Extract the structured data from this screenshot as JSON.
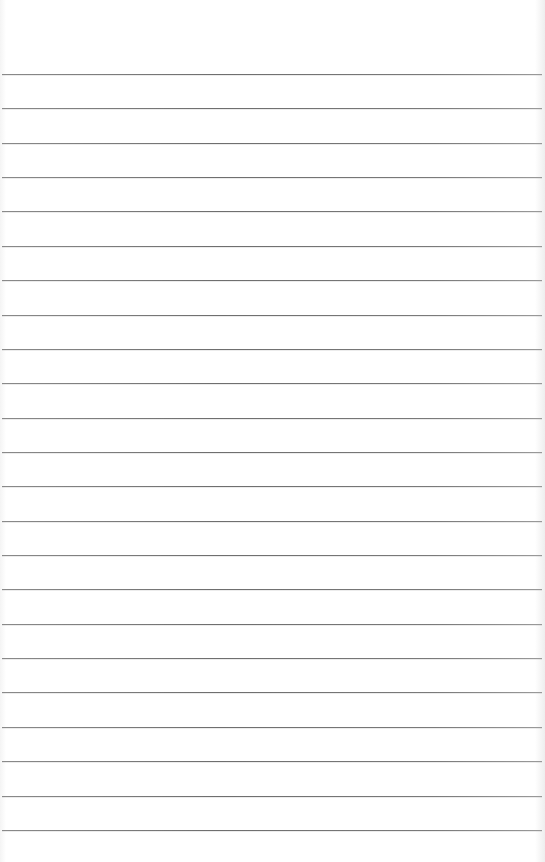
{
  "paper": {
    "type": "lined notebook paper",
    "background": "#ffffff",
    "rule_color": "#777777",
    "rule_count": 23,
    "first_rule_y": 74,
    "rule_spacing": 34.36
  }
}
